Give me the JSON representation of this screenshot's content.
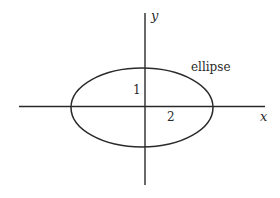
{
  "diagram": {
    "title": "",
    "axes": {
      "x_label": "x",
      "y_label": "y"
    },
    "shape": {
      "name": "ellipse",
      "label": "ellipse",
      "semi_major_label": "2",
      "semi_minor_label": "1"
    },
    "colors": {
      "stroke": "#2a2a2a",
      "background": "#ffffff"
    }
  }
}
